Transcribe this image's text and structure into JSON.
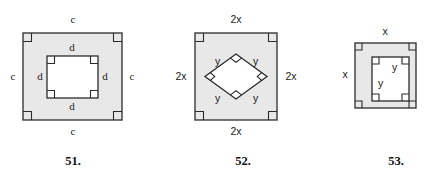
{
  "page": {
    "background_color": "#ffffff",
    "shading_color": "#e8e8e8",
    "stroke_color": "#2b2b2b",
    "text_color": "#1a1a1a"
  },
  "figures": [
    {
      "number": "51.",
      "shape_description": "large shaded square with centered white square hole",
      "outer_labels": {
        "top": "c",
        "left": "c",
        "right": "c",
        "bottom": "c"
      },
      "inner_labels": {
        "top": "d",
        "left": "d",
        "right": "d",
        "bottom": "d"
      },
      "right_angle_marks": 8
    },
    {
      "number": "52.",
      "shape_description": "large shaded square with centered white diamond hole rotated 45 degrees",
      "outer_labels": {
        "top": "2x",
        "left": "2x",
        "right": "2x",
        "bottom": "2x"
      },
      "inner_labels": {
        "upper_left": "y",
        "upper_right": "y",
        "lower_left": "y",
        "lower_right": "y"
      },
      "right_angle_marks": 8
    },
    {
      "number": "53.",
      "shape_description": "small shaded square with offset white square hole toward bottom right",
      "outer_labels": {
        "top": "x",
        "left": "x"
      },
      "inner_labels": {
        "upper_right": "y",
        "lower_left": "y"
      },
      "right_angle_marks": 8
    }
  ]
}
